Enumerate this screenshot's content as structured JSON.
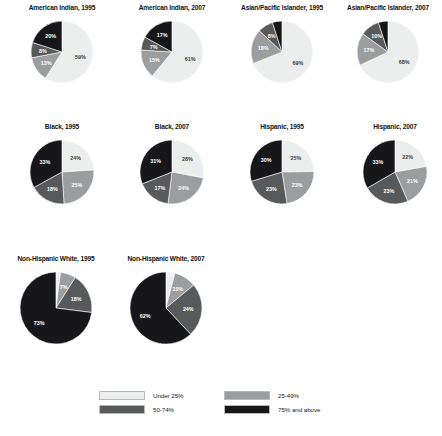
{
  "palette": {
    "under25": "#eceded",
    "r25_49": "#9b9d9e",
    "r50_74": "#58595b",
    "r75plus": "#17171a",
    "label_light": "#ffffff",
    "label_dark": "#3c3c3c",
    "background": "#ffffff"
  },
  "legend": {
    "items": [
      {
        "label": "Under 25%",
        "color_key": "under25"
      },
      {
        "label": "25-49%",
        "color_key": "r25_49"
      },
      {
        "label": "50-74%",
        "color_key": "r50_74"
      },
      {
        "label": "75% and above",
        "color_key": "r75plus"
      }
    ]
  },
  "chart_data": {
    "type": "pie",
    "title": "",
    "legend_position": "bottom",
    "categories": [
      "Under 25%",
      "25-49%",
      "50-74%",
      "75% and above"
    ],
    "series": [
      {
        "name": "American Indian, 1995",
        "values": [
          59,
          13,
          8,
          20
        ]
      },
      {
        "name": "American Indian, 2007",
        "values": [
          61,
          15,
          7,
          17
        ]
      },
      {
        "name": "Asian/Pacific Islander, 1995",
        "values": [
          69,
          18,
          8,
          5
        ]
      },
      {
        "name": "Asian/Pacific Islander, 2007",
        "values": [
          68,
          17,
          10,
          5
        ]
      },
      {
        "name": "Black, 1995",
        "values": [
          24,
          25,
          18,
          33
        ]
      },
      {
        "name": "Black, 2007",
        "values": [
          28,
          24,
          17,
          31
        ]
      },
      {
        "name": "Hispanic, 1995",
        "values": [
          25,
          23,
          23,
          30
        ]
      },
      {
        "name": "Hispanic, 2007",
        "values": [
          22,
          21,
          23,
          33
        ]
      },
      {
        "name": "Non-Hispanic White, 1995",
        "values": [
          2,
          7,
          18,
          73
        ]
      },
      {
        "name": "Non-Hispanic White, 2007",
        "values": [
          4,
          10,
          24,
          62
        ]
      }
    ],
    "value_suffix": "%"
  },
  "panels": [
    {
      "title": "American Indian, 1995",
      "values": [
        59,
        13,
        8,
        20
      ],
      "x": 7,
      "y": 3,
      "r": 31
    },
    {
      "title": "American Indian, 2007",
      "values": [
        61,
        15,
        7,
        17
      ],
      "x": 117,
      "y": 3,
      "r": 31
    },
    {
      "title": "Asian/Pacific Islander, 1995",
      "values": [
        69,
        18,
        8,
        5
      ],
      "x": 227,
      "y": 3,
      "r": 31
    },
    {
      "title": "Asian/Pacific Islander, 2007",
      "values": [
        68,
        17,
        10,
        5
      ],
      "x": 333,
      "y": 3,
      "r": 31
    },
    {
      "title": "Black, 1995",
      "values": [
        24,
        25,
        18,
        33
      ],
      "x": 7,
      "y": 122,
      "r": 32
    },
    {
      "title": "Black, 2007",
      "values": [
        28,
        24,
        17,
        31
      ],
      "x": 117,
      "y": 122,
      "r": 32
    },
    {
      "title": "Hispanic, 1995",
      "values": [
        25,
        23,
        23,
        30
      ],
      "x": 227,
      "y": 122,
      "r": 32
    },
    {
      "title": "Hispanic, 2007",
      "values": [
        22,
        21,
        23,
        33
      ],
      "x": 340,
      "y": 122,
      "r": 32
    },
    {
      "title": "Non-Hispanic White, 1995",
      "values": [
        2,
        7,
        18,
        73
      ],
      "x": 1,
      "y": 254,
      "r": 36
    },
    {
      "title": "Non-Hispanic White, 2007",
      "values": [
        4,
        10,
        24,
        62
      ],
      "x": 111,
      "y": 254,
      "r": 36
    }
  ]
}
